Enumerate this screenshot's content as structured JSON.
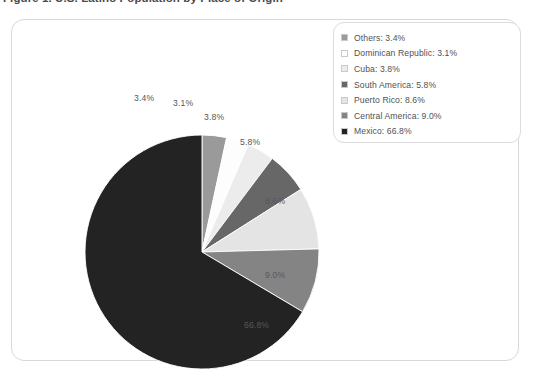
{
  "figure": {
    "title": "Figure 1. U.S. Latino Population by Place of Origin"
  },
  "legend": {
    "items": [
      {
        "label": "Others: 3.4%",
        "color": "#9a9a9a"
      },
      {
        "label": "Dominican Republic: 3.1%",
        "color": "#fdfdfd"
      },
      {
        "label": "Cuba: 3.8%",
        "color": "#ececec"
      },
      {
        "label": "South America: 5.8%",
        "color": "#676767"
      },
      {
        "label": "Puerto Rico: 8.6%",
        "color": "#e4e4e4"
      },
      {
        "label": "Central America: 9.0%",
        "color": "#848484"
      },
      {
        "label": "Mexico: 66.8%",
        "color": "#232323"
      }
    ]
  },
  "chart_data": {
    "type": "pie",
    "title": "Figure 1. U.S. Latino Population by Place of Origin",
    "xlabel": "",
    "ylabel": "",
    "legend_position": "top-right",
    "grid": false,
    "units": "percent",
    "start_angle_deg": 0,
    "direction": "clockwise",
    "categories": [
      "Others",
      "Dominican Republic",
      "Cuba",
      "South America",
      "Puerto Rico",
      "Central America",
      "Mexico"
    ],
    "values": [
      3.4,
      3.1,
      3.8,
      5.8,
      8.6,
      9.0,
      66.8
    ],
    "colors": [
      "#9a9a9a",
      "#fdfdfd",
      "#ececec",
      "#676767",
      "#e4e4e4",
      "#848484",
      "#232323"
    ],
    "data_labels": [
      "3.4%",
      "3.1%",
      "3.8%",
      "5.8%",
      "8.6%",
      "9.0%",
      "66.8%"
    ],
    "total": 100.5
  },
  "labels": {
    "p1": "3.4%",
    "p2": "3.1%",
    "p3": "3.8%",
    "p4": "5.8%",
    "p5": "8.6%",
    "p6": "9.0%",
    "p7": "66.8%"
  }
}
